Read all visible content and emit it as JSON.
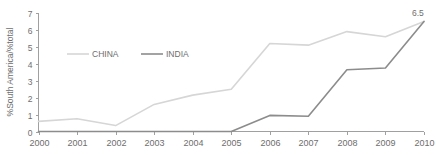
{
  "chart_data": {
    "type": "line",
    "title": "",
    "xlabel": "",
    "ylabel": "%South America/%total",
    "x": [
      2000,
      2001,
      2002,
      2003,
      2004,
      2005,
      2006,
      2007,
      2008,
      2009,
      2010
    ],
    "categories": [
      "2000",
      "2001",
      "2002",
      "2003",
      "2004",
      "2005",
      "2006",
      "2007",
      "2008",
      "2009",
      "2010"
    ],
    "xlim": [
      2000,
      2010
    ],
    "ylim": [
      0,
      7
    ],
    "yticks": [
      0,
      1,
      2,
      3,
      4,
      5,
      6,
      7
    ],
    "ytick_labels": [
      "0",
      "1",
      "2",
      "3",
      "4",
      "5",
      "6",
      "7"
    ],
    "grid": false,
    "legend_position": "upper-left-inside",
    "series": [
      {
        "name": "CHINA",
        "color": "#d6d6d6",
        "values": [
          0.6,
          0.75,
          0.35,
          1.6,
          2.15,
          2.5,
          5.2,
          5.1,
          5.9,
          5.6,
          6.5
        ]
      },
      {
        "name": "INDIA",
        "color": "#8c8c8c",
        "values": [
          0,
          0,
          0,
          0,
          0,
          0,
          0.95,
          0.9,
          3.65,
          3.75,
          6.5
        ]
      }
    ],
    "annotations": [
      {
        "text": "6.5",
        "x": 2010,
        "y": 6.5,
        "name": "endpoint-value-label"
      }
    ]
  },
  "axis": {
    "y_title": "%South America/%total"
  },
  "legend": {
    "items": [
      {
        "label": "CHINA"
      },
      {
        "label": "INDIA"
      }
    ]
  },
  "colors": {
    "china_line": "#d6d6d6",
    "india_line": "#8c8c8c",
    "axis": "#a0a0a0",
    "text": "#6e6e6e",
    "background": "#ffffff"
  }
}
